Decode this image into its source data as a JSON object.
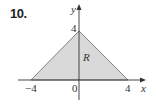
{
  "figure": {
    "problem_number": "10.",
    "region_label": "R",
    "axes": {
      "x_label": "x",
      "y_label": "y",
      "x_ticks": [
        "−4",
        "0",
        "4"
      ],
      "y_ticks": [
        "4"
      ]
    },
    "region": {
      "shape": "triangle",
      "vertices": [
        [
          -4,
          0
        ],
        [
          4,
          0
        ],
        [
          0,
          4
        ]
      ],
      "fill_color": "#d9d9d9",
      "edge_color": "#555555"
    }
  }
}
